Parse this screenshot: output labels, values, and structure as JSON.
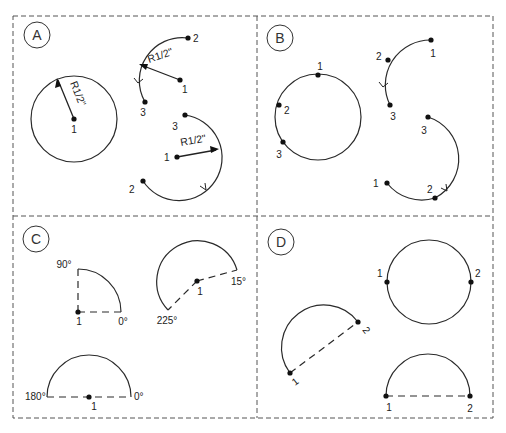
{
  "panels": {
    "A": {
      "label": "A",
      "circle": {
        "center_label": "1",
        "radius_label": "R1/2\""
      },
      "arc_upper": {
        "p1": "1",
        "p2": "2",
        "p3": "3",
        "radius_label": "R1/2\""
      },
      "arc_lower": {
        "p1": "1",
        "p2": "2",
        "p3": "3",
        "radius_label": "R1/2\""
      }
    },
    "B": {
      "label": "B",
      "circle": {
        "p1": "1",
        "p2": "2",
        "p3": "3"
      },
      "arc_upper": {
        "p1": "1",
        "p2": "2",
        "p3": "3"
      },
      "arc_lower": {
        "p1": "1",
        "p2": "2",
        "p3": "3"
      }
    },
    "C": {
      "label": "C",
      "quarter": {
        "center_label": "1",
        "start_angle": "0°",
        "end_angle": "90°"
      },
      "sector": {
        "center_label": "1",
        "start_angle": "15°",
        "end_angle": "225°"
      },
      "semicircle": {
        "center_label": "1",
        "start_angle": "0°",
        "end_angle": "180°"
      }
    },
    "D": {
      "label": "D",
      "tilted_semicircle": {
        "p1": "1",
        "p2": "2"
      },
      "circle": {
        "p1": "1",
        "p2": "2"
      },
      "semicircle": {
        "p1": "1",
        "p2": "2"
      }
    }
  }
}
